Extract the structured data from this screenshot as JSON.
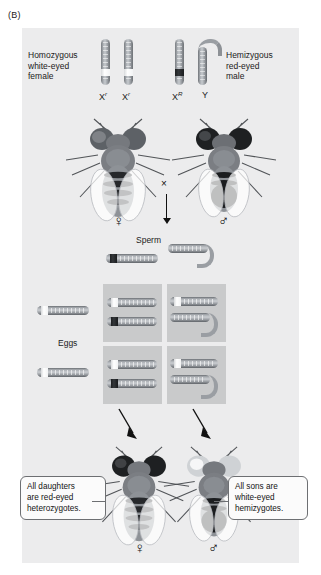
{
  "figure": {
    "panel_label": "(B)",
    "background": "#ececed"
  },
  "parents": {
    "female": {
      "description": "Homozygous\nwhite-eyed\nfemale",
      "chromosomes": [
        {
          "label_base": "X",
          "label_sup": "r",
          "allele": "white",
          "band": "white"
        },
        {
          "label_base": "X",
          "label_sup": "r",
          "allele": "white",
          "band": "white"
        }
      ],
      "sex_symbol": "♀"
    },
    "male": {
      "description": "Hemizygous\nred-eyed\nmale",
      "chromosomes": [
        {
          "label_base": "X",
          "label_sup": "R",
          "allele": "red",
          "band": "dark"
        },
        {
          "label_base": "Y",
          "label_sup": "",
          "allele": "none",
          "band": "none"
        }
      ],
      "sex_symbol": "♂"
    },
    "cross_symbol": "×"
  },
  "gametes": {
    "sperm_label": "Sperm",
    "eggs_label": "Eggs",
    "sperm": [
      {
        "type": "X",
        "label": "X^R",
        "band": "dark"
      },
      {
        "type": "Y",
        "label": "Y",
        "band": "none"
      }
    ],
    "eggs": [
      {
        "type": "X",
        "label": "X^r",
        "band": "white"
      },
      {
        "type": "X",
        "label": "X^r",
        "band": "white"
      }
    ]
  },
  "punnett": {
    "rows": 2,
    "columns": 2,
    "cells": [
      {
        "row": 0,
        "col": 0,
        "genotype": "X^r X^R",
        "phenotype": "red-eyed heterozygous daughter",
        "chromosomes": [
          {
            "type": "X",
            "band": "white"
          },
          {
            "type": "X",
            "band": "dark"
          }
        ]
      },
      {
        "row": 0,
        "col": 1,
        "genotype": "X^r Y",
        "phenotype": "white-eyed hemizygous son",
        "chromosomes": [
          {
            "type": "X",
            "band": "white"
          },
          {
            "type": "Y",
            "band": "none"
          }
        ]
      },
      {
        "row": 1,
        "col": 0,
        "genotype": "X^r X^R",
        "phenotype": "red-eyed heterozygous daughter",
        "chromosomes": [
          {
            "type": "X",
            "band": "white"
          },
          {
            "type": "X",
            "band": "dark"
          }
        ]
      },
      {
        "row": 1,
        "col": 1,
        "genotype": "X^r Y",
        "phenotype": "white-eyed hemizygous son",
        "chromosomes": [
          {
            "type": "X",
            "band": "white"
          },
          {
            "type": "Y",
            "band": "none"
          }
        ]
      }
    ]
  },
  "offspring": {
    "daughter": {
      "callout": "All daughters\nare red-eyed\nheterozygotes.",
      "sex_symbol": "♀",
      "eye_color": "red"
    },
    "son": {
      "callout": "All sons are\nwhite-eyed\nhemizygotes.",
      "sex_symbol": "♂",
      "eye_color": "white"
    }
  }
}
